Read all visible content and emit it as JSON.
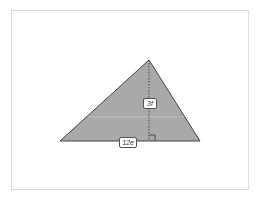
{
  "diagram": {
    "shape": "triangle",
    "fill_color": "#a9a9a9",
    "stroke_color": "#444444",
    "height_label": "3f",
    "base_label": "12e",
    "right_angle_marker": true
  }
}
